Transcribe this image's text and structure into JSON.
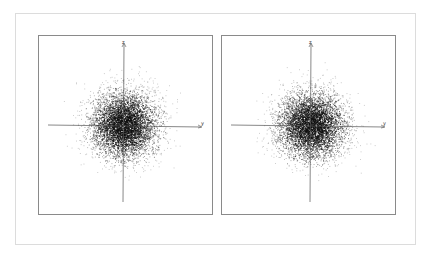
{
  "chart_data": [
    {
      "type": "scatter",
      "title": "",
      "xlabel": "y",
      "ylabel": "z",
      "description": "2D Gaussian point cloud centered at origin with crosshair axes",
      "distribution": {
        "mean": [
          0,
          0
        ],
        "std": [
          1,
          1
        ],
        "n_points": 5000
      },
      "grid": false,
      "legend": null
    },
    {
      "type": "scatter",
      "title": "",
      "xlabel": "y",
      "ylabel": "z",
      "description": "2D Gaussian point cloud centered at origin with crosshair axes",
      "distribution": {
        "mean": [
          0,
          0
        ],
        "std": [
          1,
          1
        ],
        "n_points": 5000
      },
      "grid": false,
      "legend": null
    }
  ],
  "panels": [
    {
      "x_axis_label": "y",
      "y_axis_label": "z"
    },
    {
      "x_axis_label": "y",
      "y_axis_label": "z"
    }
  ],
  "colors": {
    "points": "#111111",
    "axes": "#555555",
    "border": "#8a8a8a",
    "frame": "#dcdcdc"
  }
}
